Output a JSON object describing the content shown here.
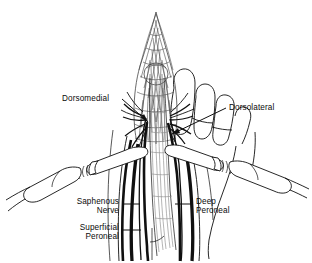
{
  "figure": {
    "background_color": "#ffffff",
    "ink_color": "#101010",
    "mesh_color": "#3a3a3a",
    "hatch_color": "#8d8d8d",
    "width": 312,
    "height": 263
  },
  "labels": {
    "dorsomedial": {
      "text": "Dorsomedial",
      "x": 62,
      "y": 101
    },
    "dorsolateral": {
      "text": "Dorsolateral",
      "x": 229,
      "y": 106
    },
    "saphenous_nerve": {
      "line1": "Saphenous",
      "line2": "Nerve",
      "x": 66,
      "y": 204
    },
    "superficial_peroneal": {
      "line1": "Superficial",
      "line2": "Peroneal",
      "x": 66,
      "y": 230
    },
    "deep_peroneal": {
      "line1": "Deep",
      "line2": "Peroneal",
      "x": 196,
      "y": 204
    }
  },
  "structures": {
    "mesh_sleeve": "braided-mesh-sleeve",
    "tendon_band": "shaded-tendon-band",
    "toes": "toe-lobes",
    "left_retractor": "left-retractor-instrument",
    "right_retractor": "right-retractor-instrument",
    "nerve_branches": "radiating-nerve-branches"
  }
}
